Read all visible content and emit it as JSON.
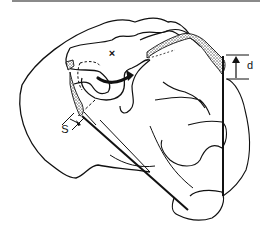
{
  "figure": {
    "labels": {
      "cross_mark": "×",
      "s_label": "S",
      "d_label": "d"
    },
    "colors": {
      "stroke": "#111111",
      "rule": "#8a8a8a",
      "stipple": "#555555",
      "background": "#ffffff"
    }
  }
}
